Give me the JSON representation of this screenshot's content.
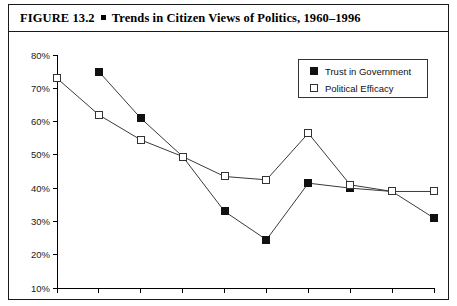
{
  "figure": {
    "label": "FIGURE 13.2",
    "bullet": "square-bullet",
    "title": "Trends in Citizen Views of Politics, 1960–1996"
  },
  "legend": {
    "position": "top-right",
    "entries": [
      {
        "label": "Trust in Government",
        "marker": "filled-square"
      },
      {
        "label": "Political Efficacy",
        "marker": "open-square"
      }
    ]
  },
  "chart_data": {
    "type": "line",
    "title": "Trends in Citizen Views of Politics, 1960–1996",
    "xlabel": "",
    "ylabel": "",
    "x": [
      1960,
      1964,
      1968,
      1972,
      1976,
      1980,
      1984,
      1988,
      1992,
      1996
    ],
    "categories": [
      "1960",
      "1964",
      "1968",
      "1972",
      "1976",
      "1980",
      "1984",
      "1988",
      "1992",
      "1996"
    ],
    "xlim": [
      1960,
      1996
    ],
    "ylim": [
      10,
      80
    ],
    "ytick_labels": [
      "10%",
      "20%",
      "30%",
      "40%",
      "50%",
      "60%",
      "70%",
      "80%"
    ],
    "yticks": [
      10,
      20,
      30,
      40,
      50,
      60,
      70,
      80
    ],
    "grid": false,
    "series": [
      {
        "name": "Trust in Government",
        "marker": "filled-square",
        "x": [
          1964,
          1968,
          1972,
          1976,
          1980,
          1984,
          1988,
          1992,
          1996
        ],
        "values": [
          75,
          61,
          49.5,
          33,
          24.5,
          41.5,
          40,
          39,
          31
        ]
      },
      {
        "name": "Political Efficacy",
        "marker": "open-square",
        "x": [
          1960,
          1964,
          1968,
          1972,
          1976,
          1980,
          1984,
          1988,
          1992,
          1996
        ],
        "values": [
          73,
          62,
          54.5,
          49.5,
          43.5,
          42.5,
          56.5,
          41,
          39,
          39
        ]
      }
    ]
  }
}
